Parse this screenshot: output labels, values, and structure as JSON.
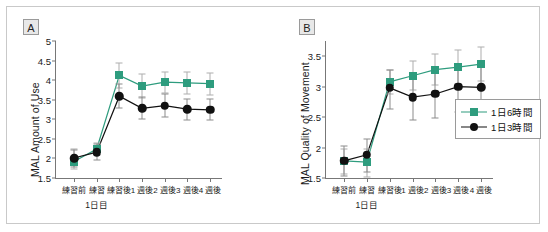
{
  "figure": {
    "panel_a_tag": "A",
    "panel_b_tag": "B"
  },
  "legend": {
    "position": "right",
    "entries": [
      {
        "label": "1日6時間",
        "marker": "square",
        "color": "#2e9c7e"
      },
      {
        "label": "1日3時間",
        "marker": "circle",
        "color": "#111111"
      }
    ]
  },
  "chart_data": [
    {
      "type": "line",
      "panel": "A",
      "title": "",
      "xlabel": "",
      "ylabel": "MAL Amount of Use",
      "group_label": "1日目",
      "ylim": [
        1.5,
        5
      ],
      "yticks": [
        "1.5",
        "2",
        "2.5",
        "3",
        "3.5",
        "4",
        "4.5",
        "5"
      ],
      "ytick_values": [
        1.5,
        2,
        2.5,
        3,
        3.5,
        4,
        4.5,
        5
      ],
      "grid": false,
      "categories": [
        "練習前",
        "練習",
        "練習後",
        "1 週後",
        "2 週後",
        "3 週後",
        "4 週後"
      ],
      "series": [
        {
          "name": "1日6時間",
          "color": "#2e9c7e",
          "marker": "square",
          "values": [
            1.92,
            2.24,
            4.12,
            3.85,
            3.95,
            3.93,
            3.91
          ],
          "err_low": [
            0.2,
            0.14,
            0.33,
            0.3,
            0.27,
            0.28,
            0.28
          ],
          "err_high": [
            0.33,
            0.16,
            0.33,
            0.3,
            0.27,
            0.28,
            0.28
          ]
        },
        {
          "name": "1日3時間",
          "color": "#111111",
          "marker": "circle",
          "values": [
            2.01,
            2.16,
            3.59,
            3.28,
            3.35,
            3.26,
            3.24
          ],
          "err_low": [
            0.22,
            0.2,
            0.3,
            0.28,
            0.3,
            0.27,
            0.27
          ],
          "err_high": [
            0.2,
            0.22,
            0.3,
            0.28,
            0.3,
            0.27,
            0.27
          ]
        }
      ]
    },
    {
      "type": "line",
      "panel": "B",
      "title": "",
      "xlabel": "",
      "ylabel": "MAL Quality of Movement",
      "group_label": "1日目",
      "ylim": [
        1.5,
        3.75
      ],
      "yticks": [
        "1.5",
        "2",
        "2.5",
        "3",
        "3.5"
      ],
      "ytick_values": [
        1.5,
        2,
        2.5,
        3,
        3.5
      ],
      "grid": false,
      "categories": [
        "練習前",
        "練習",
        "練習後",
        "1 週後",
        "2 週後",
        "3 週後",
        "4 週後"
      ],
      "series": [
        {
          "name": "1日6時間",
          "color": "#2e9c7e",
          "marker": "square",
          "values": [
            1.78,
            1.76,
            3.08,
            3.18,
            3.28,
            3.32,
            3.37
          ],
          "err_low": [
            0.22,
            0.25,
            0.2,
            0.24,
            0.26,
            0.28,
            0.28
          ],
          "err_high": [
            0.2,
            0.22,
            0.2,
            0.24,
            0.26,
            0.28,
            0.28
          ]
        },
        {
          "name": "1日3時間",
          "color": "#111111",
          "marker": "circle",
          "values": [
            1.78,
            1.88,
            2.98,
            2.83,
            2.88,
            3.0,
            2.99
          ],
          "err_low": [
            0.24,
            0.28,
            0.35,
            0.38,
            0.4,
            0.42,
            0.42
          ],
          "err_high": [
            0.24,
            0.26,
            0.3,
            0.34,
            0.36,
            0.38,
            0.38
          ]
        }
      ]
    }
  ]
}
